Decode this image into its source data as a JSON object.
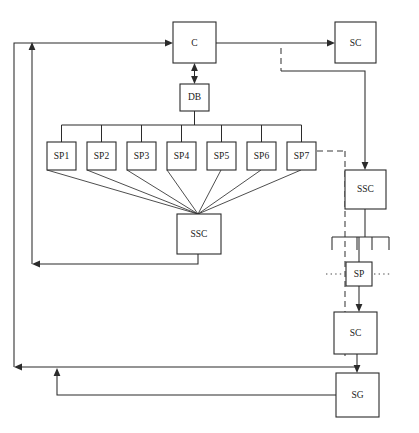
{
  "diagram": {
    "canvas": {
      "width": 419,
      "height": 433
    },
    "colors": {
      "background": "#ffffff",
      "stroke": "#2b2b2b",
      "text": "#1a1a1a",
      "dashed_stroke": "#3a3a3a"
    },
    "nodes": [
      {
        "id": "c",
        "label": "C",
        "x": 173,
        "y": 22,
        "w": 43,
        "h": 41
      },
      {
        "id": "sc_top",
        "label": "SC",
        "x": 335,
        "y": 22,
        "w": 41,
        "h": 41
      },
      {
        "id": "db",
        "label": "DB",
        "x": 180,
        "y": 84,
        "w": 29,
        "h": 27
      },
      {
        "id": "sp1",
        "label": "SP1",
        "x": 47,
        "y": 142,
        "w": 29,
        "h": 28
      },
      {
        "id": "sp2",
        "label": "SP2",
        "x": 87,
        "y": 142,
        "w": 29,
        "h": 28
      },
      {
        "id": "sp3",
        "label": "SP3",
        "x": 127,
        "y": 142,
        "w": 29,
        "h": 28
      },
      {
        "id": "sp4",
        "label": "SP4",
        "x": 167,
        "y": 142,
        "w": 29,
        "h": 28
      },
      {
        "id": "sp5",
        "label": "SP5",
        "x": 207,
        "y": 142,
        "w": 29,
        "h": 28
      },
      {
        "id": "sp6",
        "label": "SP6",
        "x": 247,
        "y": 142,
        "w": 29,
        "h": 28
      },
      {
        "id": "sp7",
        "label": "SP7",
        "x": 287,
        "y": 142,
        "w": 29,
        "h": 28
      },
      {
        "id": "ssc_mid",
        "label": "SSC",
        "x": 177,
        "y": 214,
        "w": 44,
        "h": 40
      },
      {
        "id": "ssc_right",
        "label": "SSC",
        "x": 345,
        "y": 170,
        "w": 41,
        "h": 39
      },
      {
        "id": "sp_right",
        "label": "SP",
        "x": 346,
        "y": 262,
        "w": 26,
        "h": 24
      },
      {
        "id": "sc_bottom",
        "label": "SC",
        "x": 334,
        "y": 312,
        "w": 43,
        "h": 42
      },
      {
        "id": "sg",
        "label": "SG",
        "x": 336,
        "y": 373,
        "w": 43,
        "h": 44
      }
    ],
    "ellipsis": [
      {
        "id": "sp-left-ellipsis",
        "x1": 326,
        "y": 274,
        "x2": 344
      },
      {
        "id": "sp-right-ellipsis",
        "x1": 374,
        "y": 274,
        "x2": 392
      }
    ],
    "edges": [
      {
        "id": "feedback-to-c",
        "from": "outer-loop",
        "to": "c",
        "style": "solid",
        "arrow": true
      },
      {
        "id": "c-to-sc-top",
        "from": "c",
        "to": "sc_top",
        "style": "solid",
        "arrow": true
      },
      {
        "id": "c-to-db",
        "from": "c",
        "to": "db",
        "style": "solid",
        "arrow": "both"
      },
      {
        "id": "db-to-sp-bus",
        "from": "db",
        "to": "sp-bus",
        "style": "solid",
        "arrow": false
      },
      {
        "id": "sp-fanin-to-ssc",
        "from": "sp1..sp7",
        "to": "ssc_mid",
        "style": "solid",
        "arrow": false
      },
      {
        "id": "ssc-mid-feedback",
        "from": "ssc_mid",
        "to": "inner-loop",
        "style": "solid",
        "arrow": true
      },
      {
        "id": "sp7-dashed-branch",
        "from": "sp7",
        "to": "dashed-rail",
        "style": "dashed",
        "arrow": false
      },
      {
        "id": "sc-top-to-ssc-right",
        "from": "sc_top",
        "to": "ssc_right",
        "style": "solid",
        "arrow": true
      },
      {
        "id": "ssc-right-to-bus",
        "from": "ssc_right",
        "to": "right-bus",
        "style": "solid",
        "arrow": false
      },
      {
        "id": "bus-to-sp-right",
        "from": "right-bus",
        "to": "sp_right",
        "style": "solid",
        "arrow": false
      },
      {
        "id": "sp-right-to-sc-bottom",
        "from": "sp_right",
        "to": "sc_bottom",
        "style": "solid",
        "arrow": true
      },
      {
        "id": "sc-bottom-to-sg",
        "from": "sc_bottom",
        "to": "sg",
        "style": "solid",
        "arrow": true
      },
      {
        "id": "sg-feedback",
        "from": "sg",
        "to": "outer-loop",
        "style": "solid",
        "arrow": true
      },
      {
        "id": "sc-bottom-feedback",
        "from": "sc_bottom",
        "to": "outer-loop",
        "style": "solid",
        "arrow": true
      }
    ]
  }
}
